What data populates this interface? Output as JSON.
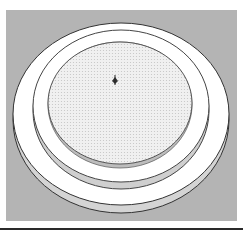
{
  "viewport": {
    "background": "#b4b4b4",
    "model": {
      "name": "stacked-circular-platform",
      "outer_ring": {
        "fill": "#ffffff",
        "side": "#d6d6d6",
        "edge": "#333333"
      },
      "inner_ring": {
        "fill": "#ffffff",
        "side": "#cfcfcf",
        "edge": "#444444"
      },
      "disc": {
        "fill": "#ececec",
        "pattern": "dotted",
        "edge": "#555555"
      }
    },
    "axes_origin_icon": "axes-origin-icon"
  }
}
